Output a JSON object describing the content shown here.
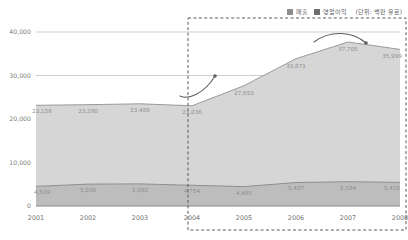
{
  "legend": {
    "revenue_label": "매출",
    "profit_label": "영업이익",
    "unit_label": "(단위: 백만 유로)",
    "revenue_color": "#8d8d8d",
    "profit_color": "#6f6f6f"
  },
  "chart_data": {
    "type": "area",
    "title": "",
    "subtitle": "",
    "xlabel": "",
    "ylabel": "",
    "unit": "(단위: 백만 유로)",
    "categories": [
      "2001",
      "2002",
      "2003",
      "2004",
      "2005",
      "2006",
      "2007",
      "2008"
    ],
    "ylim": [
      0,
      40000
    ],
    "yticks": [
      0,
      10000,
      20000,
      30000,
      40000
    ],
    "ytick_labels": [
      "0",
      "10,000",
      "20,000",
      "30,000",
      "40,000"
    ],
    "grid": true,
    "legend_position": "top-right",
    "series": [
      {
        "name": "매출",
        "color": "#d6d6d6",
        "values": [
          23158,
          23280,
          23488,
          23036,
          27653,
          33871,
          37705,
          35999
        ],
        "value_labels": [
          "23,158",
          "23,280",
          "23,488",
          "23,036",
          "27,653",
          "33,871",
          "37,705",
          "35,999"
        ]
      },
      {
        "name": "영업이익",
        "color": "#bdbdbd",
        "values": [
          4509,
          5030,
          5082,
          4754,
          4465,
          5407,
          5584,
          5416
        ],
        "value_labels": [
          "4,509",
          "5,030",
          "5,082",
          "4,754",
          "4,465",
          "5,407",
          "5,584",
          "5,416"
        ]
      }
    ],
    "annotations": [
      {
        "name": "growth-arrow",
        "from": "2004",
        "to": "2005",
        "shape": "rising-curved-arrow"
      },
      {
        "name": "decline-arrow",
        "from": "2007",
        "to": "2008",
        "shape": "arc-down-arrow"
      }
    ],
    "highlight_region": {
      "from": "2004",
      "to": "2008",
      "style": "dashed-rectangle"
    }
  }
}
